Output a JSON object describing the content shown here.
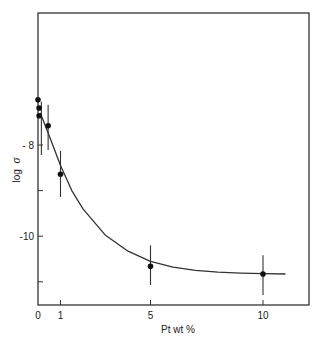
{
  "chart_data": {
    "type": "scatter",
    "title": "",
    "xlabel": "Pt  wt %",
    "ylabel": "log σ",
    "ylabel_parts": {
      "text": "log",
      "symbol": "σ"
    },
    "xlim": [
      0,
      12
    ],
    "ylim": [
      -11.5,
      -5.3
    ],
    "x_ticks": [
      0,
      1,
      5,
      10
    ],
    "x_tick_labels": [
      "0",
      "1",
      "5",
      "10"
    ],
    "y_ticks": [
      -8,
      -9,
      -10,
      -11
    ],
    "y_tick_labels": [
      "- 8",
      "",
      "-10",
      ""
    ],
    "grid": false,
    "legend": null,
    "series": [
      {
        "name": "measured",
        "points": [
          {
            "x": 0.0,
            "y": -7.01
          },
          {
            "x": 0.05,
            "y": -7.19
          },
          {
            "x": 0.05,
            "y": -7.36
          },
          {
            "x": 0.45,
            "y": -7.58
          },
          {
            "x": 1.0,
            "y": -8.64
          },
          {
            "x": 5.0,
            "y": -10.66
          },
          {
            "x": 10.0,
            "y": -10.83
          }
        ],
        "error_bars": [
          {
            "x": 0.15,
            "y_low": -8.22,
            "y_high": -7.05
          },
          {
            "x": 0.45,
            "y_low": -8.11,
            "y_high": -7.12
          },
          {
            "x": 1.0,
            "y_low": -9.14,
            "y_high": -8.13
          },
          {
            "x": 5.0,
            "y_low": -11.07,
            "y_high": -10.2
          },
          {
            "x": 10.0,
            "y_low": -11.29,
            "y_high": -10.42
          }
        ]
      },
      {
        "name": "fit curve",
        "type": "line",
        "x": [
          0.1,
          0.5,
          1,
          1.5,
          2,
          3,
          4,
          5,
          6,
          7,
          8,
          9,
          10,
          11
        ],
        "y": [
          -7.3,
          -7.8,
          -8.45,
          -9.0,
          -9.4,
          -9.98,
          -10.33,
          -10.55,
          -10.68,
          -10.75,
          -10.79,
          -10.81,
          -10.82,
          -10.83
        ]
      }
    ]
  }
}
